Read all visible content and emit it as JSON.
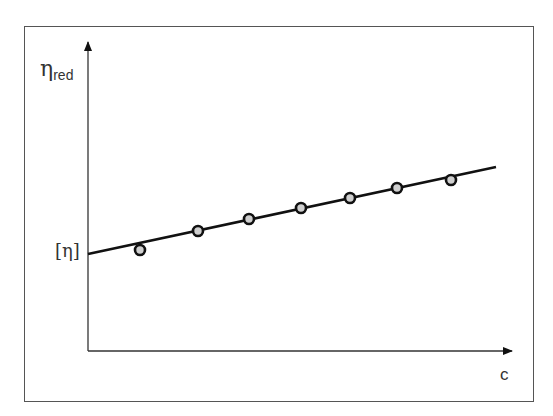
{
  "chart_data": {
    "type": "scatter",
    "title": "",
    "xlabel": "c",
    "ylabel": "η_red",
    "ylabel_main": "η",
    "ylabel_sub": "red",
    "intercept_label": "[η]",
    "grid": false,
    "legend": null,
    "x_ticks": [],
    "y_ticks": [],
    "series": [
      {
        "name": "measured points",
        "points_px": [
          [
            140,
            250
          ],
          [
            198,
            231
          ],
          [
            249,
            219
          ],
          [
            301,
            208
          ],
          [
            350,
            198
          ],
          [
            397,
            188
          ],
          [
            451,
            180
          ]
        ],
        "marker": "open-circle-grey-fill"
      },
      {
        "name": "linear fit",
        "type": "line",
        "start_px": [
          88,
          254
        ],
        "end_px": [
          496,
          167
        ]
      }
    ],
    "annotations": [
      "[η] marks the y-intercept of the fit line at c = 0"
    ]
  },
  "axes": {
    "origin_px": [
      88,
      351
    ],
    "y_top_px": 40,
    "x_right_px": 514
  }
}
